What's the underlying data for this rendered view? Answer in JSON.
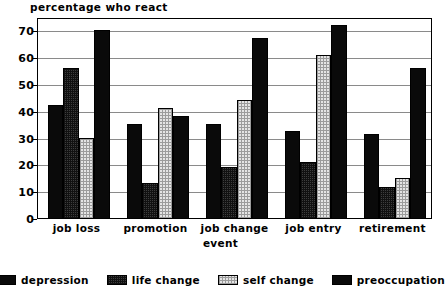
{
  "chart_data": {
    "type": "bar",
    "title": "percentage who react",
    "xlabel": "event",
    "ylabel": "",
    "ylim": [
      0,
      75
    ],
    "yticks": [
      0,
      10,
      20,
      30,
      40,
      50,
      60,
      70
    ],
    "grid": true,
    "legend_position": "bottom",
    "categories": [
      "job loss",
      "promotion",
      "job change",
      "job entry",
      "retirement"
    ],
    "series": [
      {
        "name": "depression",
        "pattern": "solid-black",
        "color": "#0a0a0a",
        "values": [
          42,
          35,
          35,
          32.5,
          31.5
        ]
      },
      {
        "name": "life change",
        "pattern": "dark-checker",
        "color": "#3d3d3d",
        "values": [
          56,
          13,
          19,
          21,
          11.5
        ]
      },
      {
        "name": "self change",
        "pattern": "light-checker",
        "color": "#e4e4e4",
        "values": [
          30,
          41,
          44,
          61,
          15
        ]
      },
      {
        "name": "preoccupation",
        "pattern": "solid-black",
        "color": "#0a0a0a",
        "values": [
          70,
          38,
          67,
          72,
          56
        ]
      }
    ]
  },
  "ytick_labels": [
    "70",
    "60",
    "50",
    "40",
    "30",
    "20",
    "10",
    "0"
  ],
  "legend": {
    "items": [
      {
        "label": "depression"
      },
      {
        "label": "life change"
      },
      {
        "label": "self change"
      },
      {
        "label": "preoccupation"
      }
    ]
  }
}
